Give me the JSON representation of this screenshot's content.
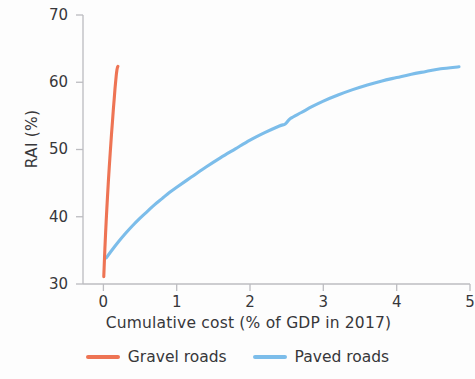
{
  "chart_data": {
    "type": "line",
    "title": "",
    "xlabel": "Cumulative cost (% of GDP in 2017)",
    "ylabel": "RAI (%)",
    "xlim": [
      0,
      5
    ],
    "ylim": [
      30,
      70
    ],
    "xticks": [
      "0",
      "1",
      "2",
      "3",
      "4",
      "5"
    ],
    "yticks": [
      "30",
      "40",
      "50",
      "60",
      "70"
    ],
    "grid": false,
    "legend_position": "bottom-center",
    "series": [
      {
        "name": "Gravel roads",
        "color": "#ee7454",
        "points": [
          [
            0.005,
            31.1
          ],
          [
            0.012,
            33.0
          ],
          [
            0.02,
            35.2
          ],
          [
            0.03,
            37.6
          ],
          [
            0.042,
            40.2
          ],
          [
            0.055,
            42.8
          ],
          [
            0.068,
            45.3
          ],
          [
            0.082,
            47.7
          ],
          [
            0.096,
            50.0
          ],
          [
            0.11,
            52.2
          ],
          [
            0.124,
            54.2
          ],
          [
            0.136,
            56.0
          ],
          [
            0.148,
            57.6
          ],
          [
            0.158,
            59.0
          ],
          [
            0.168,
            60.2
          ],
          [
            0.176,
            61.1
          ],
          [
            0.184,
            61.8
          ],
          [
            0.192,
            62.2
          ],
          [
            0.198,
            62.35
          ]
        ]
      },
      {
        "name": "Paved roads",
        "color": "#7cbdea",
        "points": [
          [
            0.04,
            33.9
          ],
          [
            0.1,
            34.8
          ],
          [
            0.2,
            36.2
          ],
          [
            0.3,
            37.5
          ],
          [
            0.4,
            38.7
          ],
          [
            0.5,
            39.8
          ],
          [
            0.6,
            40.8
          ],
          [
            0.7,
            41.8
          ],
          [
            0.8,
            42.7
          ],
          [
            0.9,
            43.6
          ],
          [
            1.0,
            44.4
          ],
          [
            1.2,
            45.9
          ],
          [
            1.4,
            47.4
          ],
          [
            1.6,
            48.8
          ],
          [
            1.8,
            50.1
          ],
          [
            2.0,
            51.4
          ],
          [
            2.2,
            52.5
          ],
          [
            2.4,
            53.5
          ],
          [
            2.48,
            53.8
          ],
          [
            2.55,
            54.6
          ],
          [
            2.7,
            55.5
          ],
          [
            2.85,
            56.4
          ],
          [
            3.0,
            57.2
          ],
          [
            3.2,
            58.1
          ],
          [
            3.4,
            58.9
          ],
          [
            3.6,
            59.6
          ],
          [
            3.8,
            60.2
          ],
          [
            4.0,
            60.7
          ],
          [
            4.2,
            61.2
          ],
          [
            4.4,
            61.6
          ],
          [
            4.6,
            62.0
          ],
          [
            4.85,
            62.3
          ]
        ]
      }
    ]
  },
  "axes": {
    "y_title": "RAI (%)",
    "x_title": "Cumulative cost (% of GDP in 2017)",
    "y_tick_0": "30",
    "y_tick_1": "40",
    "y_tick_2": "50",
    "y_tick_3": "60",
    "y_tick_4": "70",
    "x_tick_0": "0",
    "x_tick_1": "1",
    "x_tick_2": "2",
    "x_tick_3": "3",
    "x_tick_4": "4",
    "x_tick_5": "5",
    "axis_color": "#b9b9bd"
  },
  "legend": {
    "gravel_label": "Gravel roads",
    "paved_label": "Paved roads",
    "gravel_color": "#ee7454",
    "paved_color": "#7cbdea"
  }
}
